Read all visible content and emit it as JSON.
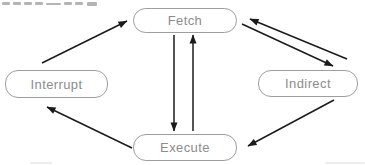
{
  "diagram": {
    "type": "state-diagram",
    "colors": {
      "background": "#ffffff",
      "node_border": "#9e9e9e",
      "node_fill": "#ffffff",
      "node_text": "#8c8c8c",
      "arrow": "#1b1b1b"
    },
    "nodes": [
      {
        "id": "fetch",
        "label": "Fetch",
        "x": 133,
        "y": 8,
        "w": 104,
        "h": 25
      },
      {
        "id": "interrupt",
        "label": "Interrupt",
        "x": 5,
        "y": 70,
        "w": 103,
        "h": 28
      },
      {
        "id": "indirect",
        "label": "Indirect",
        "x": 258,
        "y": 70,
        "w": 100,
        "h": 27
      },
      {
        "id": "execute",
        "label": "Execute",
        "x": 133,
        "y": 134,
        "w": 104,
        "h": 27
      }
    ],
    "edges": [
      {
        "from": "interrupt",
        "to": "fetch",
        "x1": 42,
        "y1": 63,
        "x2": 127,
        "y2": 21
      },
      {
        "from": "fetch",
        "to": "execute",
        "x1": 174,
        "y1": 35,
        "x2": 174,
        "y2": 131
      },
      {
        "from": "execute",
        "to": "fetch",
        "x1": 193,
        "y1": 131,
        "x2": 193,
        "y2": 35
      },
      {
        "from": "indirect",
        "to": "fetch",
        "x1": 347,
        "y1": 59,
        "x2": 250,
        "y2": 19
      },
      {
        "from": "fetch",
        "to": "indirect",
        "x1": 242,
        "y1": 24,
        "x2": 333,
        "y2": 66
      },
      {
        "from": "indirect",
        "to": "execute",
        "x1": 334,
        "y1": 100,
        "x2": 248,
        "y2": 146
      },
      {
        "from": "execute",
        "to": "interrupt",
        "x1": 132,
        "y1": 148,
        "x2": 47,
        "y2": 107
      }
    ],
    "caption_fragment_marks": [
      {
        "x": 2,
        "y": 2,
        "w": 8,
        "h": 3
      },
      {
        "x": 13,
        "y": 2,
        "w": 8,
        "h": 3
      },
      {
        "x": 24,
        "y": 2,
        "w": 8,
        "h": 3
      },
      {
        "x": 35,
        "y": 2,
        "w": 8,
        "h": 3
      },
      {
        "x": 46,
        "y": 3,
        "w": 15,
        "h": 2
      },
      {
        "x": 64,
        "y": 2,
        "w": 8,
        "h": 3
      },
      {
        "x": 75,
        "y": 2,
        "w": 8,
        "h": 3
      },
      {
        "x": 87,
        "y": 2,
        "w": 10,
        "h": 4
      }
    ],
    "scan_smudges": [
      {
        "x": 30,
        "y": 162,
        "w": 22
      },
      {
        "x": 325,
        "y": 162,
        "w": 40
      }
    ]
  }
}
